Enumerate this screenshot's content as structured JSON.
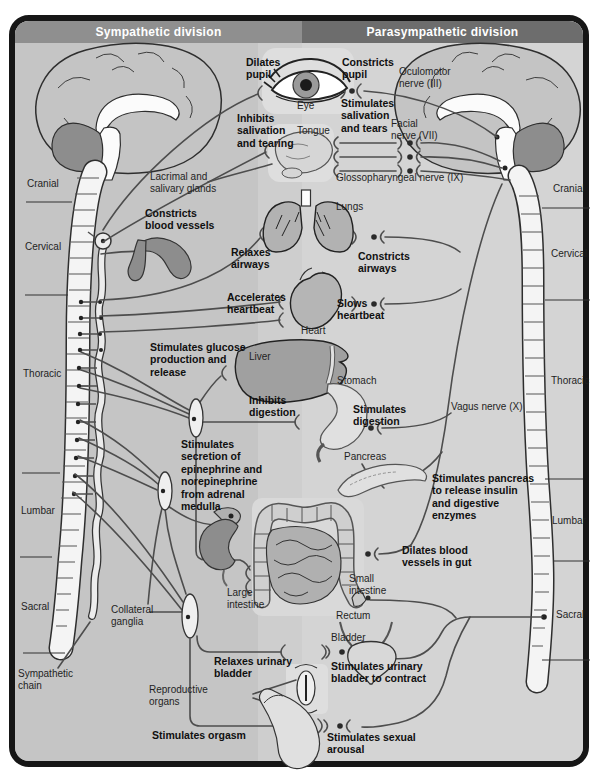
{
  "sympathetic": {
    "title": "Sympathetic division",
    "dilates_pupil": "Dilates\npupil",
    "inhibits_salivation": "Inhibits\nsalivation\nand tearing",
    "constricts_vessels": "Constricts\nblood vessels",
    "relaxes_airways": "Relaxes\nairways",
    "accelerates_heartbeat": "Accelerates\nheartbeat",
    "glucose": "Stimulates glucose\nproduction and\nrelease",
    "inhibits_digestion": "Inhibits\ndigestion",
    "epinephrine": "Stimulates\nsecretion of\nepinephrine and\nnorepinephrine\nfrom adrenal\nmedulla",
    "relaxes_bladder": "Relaxes urinary\nbladder",
    "orgasm": "Stimulates orgasm"
  },
  "parasympathetic": {
    "title": "Parasympathetic division",
    "constricts_pupil": "Constricts\npupil",
    "stimulates_salivation": "Stimulates\nsalivation\nand tears",
    "constricts_airways": "Constricts\nairways",
    "slows_heartbeat": "Slows\nheartbeat",
    "stimulates_digestion": "Stimulates\ndigestion",
    "pancreas_action": "Stimulates pancreas\nto release insulin\nand digestive\nenzymes",
    "dilates_gut": "Dilates blood\nvessels in gut",
    "stimulates_bladder": "Stimulates urinary\nbladder to contract",
    "arousal": "Stimulates sexual\narousal"
  },
  "nerves": {
    "oculomotor": "Oculomotor\nnerve (III)",
    "facial": "Facial\nnerve (VII)",
    "glossopharyngeal": "Glossopharyngeal nerve (IX)",
    "vagus": "Vagus nerve (X)"
  },
  "spine_regions": [
    "Cranial",
    "Cervical",
    "Thoracic",
    "Lumbar",
    "Sacral"
  ],
  "anatomy": {
    "eye": "Eye",
    "tongue": "Tongue",
    "lacrimal": "Lacrimal and\nsalivary glands",
    "lungs": "Lungs",
    "heart": "Heart",
    "liver": "Liver",
    "stomach": "Stomach",
    "pancreas": "Pancreas",
    "large_intestine": "Large\nintestine",
    "small_intestine": "Small\nintestine",
    "rectum": "Rectum",
    "bladder": "Bladder",
    "reproductive": "Reproductive\norgans",
    "sympathetic_chain": "Sympathetic\nchain",
    "collateral_ganglia": "Collateral\nganglia"
  },
  "colors": {
    "header_left": "#8f8f8f",
    "header_right": "#6d6d6d",
    "bg_left": "#c5c5c5",
    "bg_right": "#d4d4d4",
    "organ_gray": "#b2b2b2",
    "dark_organ_gray": "#8d8d8d",
    "nerve_line": "#4d4d4d",
    "frame": "#161616"
  }
}
